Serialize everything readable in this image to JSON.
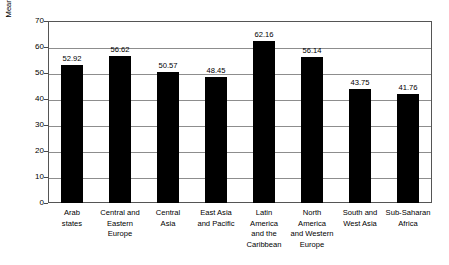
{
  "chart_data": {
    "type": "bar",
    "title": "",
    "xlabel": "",
    "ylabel": "Mean percentage of women students by region in 2005",
    "ylim": [
      0,
      70
    ],
    "ytick_values": [
      70,
      60,
      50,
      40,
      30,
      20,
      10,
      0
    ],
    "ytick_labels": [
      "70",
      "60",
      "50",
      "40",
      "30",
      "20",
      "10",
      "0"
    ],
    "grid": true,
    "legend": "none",
    "bar_color": "#000000",
    "categories": [
      "Arab\nstates",
      "Central and\nEastern\nEurope",
      "Central\nAsia",
      "East Asia\nand Pacific",
      "Latin\nAmerica\nand the\nCaribbean",
      "North\nAmerica\nand Western\nEurope",
      "South and\nWest Asia",
      "Sub-Saharan\nAfrica"
    ],
    "values": [
      52.92,
      56.62,
      50.57,
      48.45,
      62.16,
      56.14,
      43.75,
      41.76
    ],
    "value_labels": [
      "52.92",
      "56.62",
      "50.57",
      "48.45",
      "62.16",
      "56.14",
      "43.75",
      "41.76"
    ]
  }
}
